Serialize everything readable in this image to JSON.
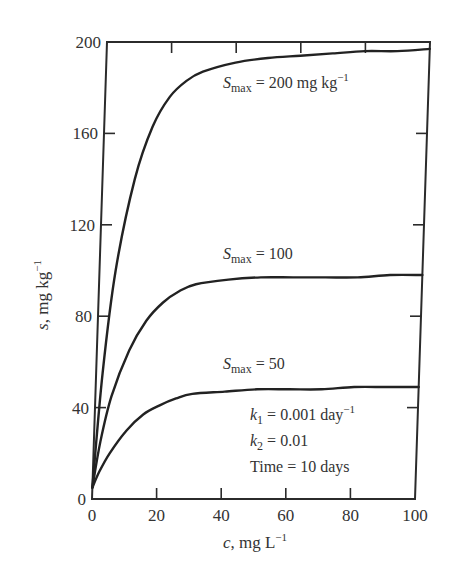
{
  "chart_data": {
    "type": "line",
    "title": "",
    "xlabel": "c, mg L−1",
    "ylabel": "s, mg kg−1",
    "xlim": [
      0,
      100
    ],
    "ylim": [
      0,
      200
    ],
    "xticks": [
      0,
      20,
      40,
      60,
      80,
      100
    ],
    "yticks": [
      0,
      40,
      80,
      120,
      160,
      200
    ],
    "grid": false,
    "legend": "none (inline annotations)",
    "x": [
      0,
      2,
      5,
      10,
      15,
      20,
      25,
      30,
      40,
      50,
      60,
      70,
      80,
      90,
      100
    ],
    "series": [
      {
        "name": "Smax = 200 mg kg-1",
        "values": [
          5,
          55,
          100,
          140,
          163,
          176,
          183,
          187,
          191,
          193,
          194,
          195,
          196,
          196,
          197
        ]
      },
      {
        "name": "Smax = 100",
        "values": [
          5,
          25,
          45,
          65,
          78,
          86,
          91,
          94,
          96,
          97,
          97,
          97,
          97,
          98,
          98
        ]
      },
      {
        "name": "Smax = 50",
        "values": [
          5,
          12,
          20,
          30,
          37,
          41,
          44,
          46,
          47,
          48,
          48,
          48,
          49,
          49,
          49
        ]
      }
    ],
    "annotations": [
      {
        "text": "Smax = 200 mg kg−1",
        "x": 57,
        "y": 187
      },
      {
        "text": "Smax = 100",
        "x": 57,
        "y": 104
      },
      {
        "text": "Smax = 50",
        "x": 57,
        "y": 56
      },
      {
        "text": "k1 = 0.001 day−1",
        "x": 53,
        "y": 40
      },
      {
        "text": "k2 = 0.01",
        "x": 53,
        "y": 30
      },
      {
        "text": "Time = 10 days",
        "x": 53,
        "y": 20
      }
    ]
  },
  "labels": {
    "y_axis_var": "s",
    "y_axis_unit": ", mg kg",
    "y_axis_exp": "−1",
    "x_axis_var": "c",
    "x_axis_unit": ", mg L",
    "x_axis_exp": "−1",
    "smax_symbol": "S",
    "smax_sub": "max",
    "smax200_value": " = 200 mg kg",
    "smax200_exp": "−1",
    "smax100_value": " = 100",
    "smax50_value": " = 50",
    "k1_symbol": "k",
    "k1_sub": "1",
    "k1_value": " = 0.001 day",
    "k1_exp": "−1",
    "k2_symbol": "k",
    "k2_sub": "2",
    "k2_value": " = 0.01",
    "time_text": "Time = 10 days"
  }
}
